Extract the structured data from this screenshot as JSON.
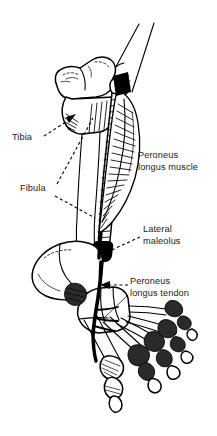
{
  "figure": {
    "view": "lateral view of right lower leg and foot",
    "background_color": "#ffffff",
    "line_color": "#000000",
    "text_color": "#1a1a1a",
    "width_px": 217,
    "height_px": 436
  },
  "labels": [
    {
      "id": "tibia",
      "text": "Tibia",
      "lines": [
        "Tibia"
      ],
      "align": "left",
      "x": 12,
      "y": 140,
      "leader": "dashed line with arrowhead pointing up-right to the proximal tibia"
    },
    {
      "id": "fibula",
      "text": "Fibula",
      "lines": [
        "Fibula"
      ],
      "align": "left",
      "x": 20,
      "y": 191,
      "leader": "dashed line running up-right to the fibular shaft"
    },
    {
      "id": "peroneus-longus-muscle",
      "text": "Peroneus longus muscle",
      "lines": [
        "Peroneus",
        "longus muscle"
      ],
      "align": "left",
      "x": 138,
      "y": 158,
      "leader": "none"
    },
    {
      "id": "lateral-maleolus",
      "text": "Lateral maleolus",
      "lines": [
        "Lateral",
        "maleolus"
      ],
      "align": "left",
      "x": 143,
      "y": 232,
      "leader": "dashed line running down-left to the lateral malleolus"
    },
    {
      "id": "peroneus-longus-tendon",
      "text": "Peroneus longus tendon",
      "lines": [
        "Peroneus",
        "longus tendon"
      ],
      "align": "left",
      "x": 130,
      "y": 284,
      "leader": "dashed line with arrowhead pointing left to the tendon behind the malleolus"
    }
  ],
  "structures": [
    {
      "id": "femur-shaft",
      "name": "distal femur shaft"
    },
    {
      "id": "tibial-plateau",
      "name": "tibial plateau / proximal tibia"
    },
    {
      "id": "fibular-head",
      "name": "head of fibula"
    },
    {
      "id": "tibia-shaft",
      "name": "tibial shaft"
    },
    {
      "id": "fibula-shaft",
      "name": "fibular shaft"
    },
    {
      "id": "peroneus-longus-belly",
      "name": "peroneus longus muscle belly"
    },
    {
      "id": "lateral-malleolus",
      "name": "lateral malleolus"
    },
    {
      "id": "calcaneus",
      "name": "calcaneus"
    },
    {
      "id": "tarsals",
      "name": "tarsal bones"
    },
    {
      "id": "metatarsals",
      "name": "metatarsal bones"
    },
    {
      "id": "phalanges",
      "name": "phalanges"
    },
    {
      "id": "peroneus-tendon-path",
      "name": "peroneus longus tendon running behind malleolus to sole"
    }
  ]
}
